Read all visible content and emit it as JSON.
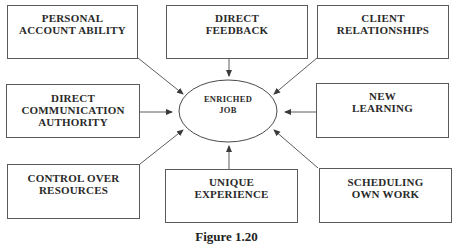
{
  "diagram": {
    "center": {
      "label": "ENRICHED\nJOB"
    },
    "boxes": [
      {
        "id": "top-left",
        "label": "PERSONAL\nACCOUNT ABILITY"
      },
      {
        "id": "top-center",
        "label": "DIRECT\nFEEDBACK"
      },
      {
        "id": "top-right",
        "label": "CLIENT\nRELATIONSHIPS"
      },
      {
        "id": "mid-left",
        "label": "DIRECT\nCOMMUNICATION\nAUTHORITY"
      },
      {
        "id": "mid-right",
        "label": "NEW\nLEARNING"
      },
      {
        "id": "bottom-left",
        "label": "CONTROL OVER\nRESOURCES"
      },
      {
        "id": "bottom-center",
        "label": "UNIQUE\nEXPERIENCE"
      },
      {
        "id": "bottom-right",
        "label": "SCHEDULING\nOWN WORK"
      }
    ],
    "caption": "Figure 1.20",
    "colors": {
      "line": "#4a4a4a",
      "text": "#2a2a2a",
      "background": "#ffffff"
    }
  }
}
